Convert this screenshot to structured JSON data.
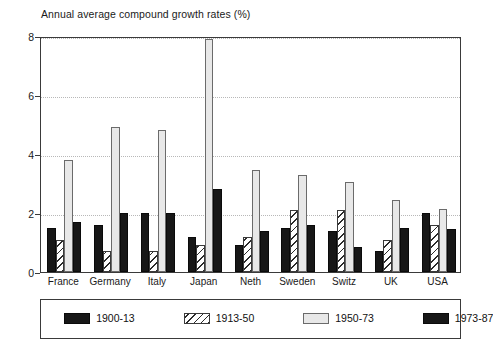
{
  "chart_data": {
    "type": "bar",
    "title": "Annual average compound growth rates (%)",
    "xlabel": "",
    "ylabel": "",
    "ylim": [
      0,
      8
    ],
    "yticks": [
      0,
      2,
      4,
      6,
      8
    ],
    "grid": true,
    "legend_position": "bottom",
    "categories": [
      "France",
      "Germany",
      "Italy",
      "Japan",
      "Neth",
      "Sweden",
      "Switz",
      "UK",
      "USA"
    ],
    "series": [
      {
        "name": "1900-13",
        "color": "#171717",
        "pattern": "solid",
        "values": [
          1.5,
          1.6,
          2.0,
          1.2,
          0.9,
          1.5,
          1.4,
          0.7,
          2.0
        ]
      },
      {
        "name": "1913-50",
        "color": "#ffffff",
        "pattern": "diagonal-hatch",
        "values": [
          1.1,
          0.7,
          0.7,
          0.9,
          1.2,
          2.1,
          2.1,
          1.1,
          1.6
        ]
      },
      {
        "name": "1950-73",
        "color": "#e8e8e8",
        "pattern": "light-fill",
        "values": [
          3.8,
          4.9,
          4.8,
          7.9,
          3.45,
          3.3,
          3.05,
          2.45,
          2.15
        ]
      },
      {
        "name": "1973-87",
        "color": "#171717",
        "pattern": "solid",
        "values": [
          1.7,
          2.0,
          2.0,
          2.8,
          1.4,
          1.6,
          0.85,
          1.5,
          1.45
        ]
      }
    ]
  }
}
